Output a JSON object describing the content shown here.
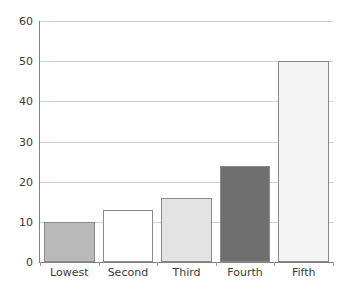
{
  "chart_data": {
    "type": "bar",
    "title": "",
    "subtitle": "",
    "xlabel": "",
    "ylabel": "",
    "categories": [
      "Lowest",
      "Second",
      "Third",
      "Fourth",
      "Fifth"
    ],
    "values": [
      10,
      13,
      16,
      24,
      50
    ],
    "bar_colors": [
      "#b9b9b9",
      "#ffffff",
      "#e3e3e3",
      "#6f6f6f",
      "#f3f3f3"
    ],
    "bar_border_color": "#8a8a8a",
    "ylim": [
      0,
      60
    ],
    "y_ticks": [
      0,
      10,
      20,
      30,
      40,
      50,
      60
    ],
    "y_tick_labels": [
      "0",
      "10",
      "20",
      "30",
      "40",
      "50",
      "60"
    ],
    "grid": true,
    "grid_color": "#d0d0d0",
    "axis_color": "#808080",
    "legend": null,
    "legend_position": "none",
    "annotations": []
  },
  "axes": {
    "y_tick_labels": [
      "60",
      "50",
      "40",
      "30",
      "20",
      "10",
      "0"
    ],
    "x_tick_labels": [
      "Lowest",
      "Second",
      "Third",
      "Fourth",
      "Fifth"
    ]
  }
}
